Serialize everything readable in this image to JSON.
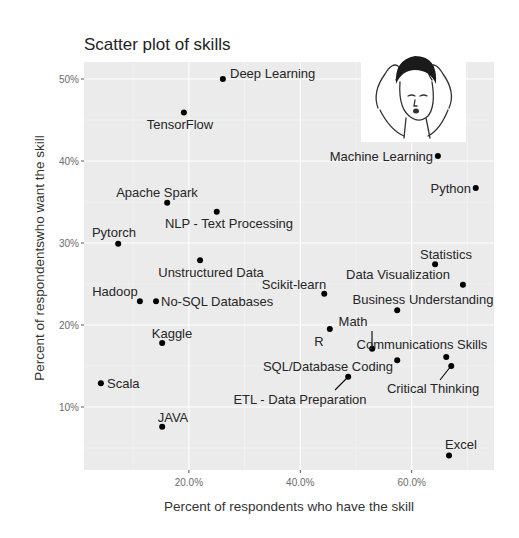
{
  "chart_data": {
    "type": "scatter",
    "title": "Scatter plot of skills",
    "xlabel": "Percent of respondents who have the skill",
    "ylabel": "Percent of respondentswho want the skill",
    "xlim": [
      1.2,
      74.8
    ],
    "ylim": [
      2.3,
      52.0
    ],
    "x_ticks": [
      {
        "value": 20,
        "label": "20.0%"
      },
      {
        "value": 40,
        "label": "40.0%"
      },
      {
        "value": 60,
        "label": "60.0%"
      }
    ],
    "y_ticks": [
      {
        "value": 10,
        "label": "10%"
      },
      {
        "value": 20,
        "label": "20%"
      },
      {
        "value": 30,
        "label": "30%"
      },
      {
        "value": 40,
        "label": "40%"
      },
      {
        "value": 50,
        "label": "50%"
      }
    ],
    "x_minor": [
      10,
      30,
      50,
      70
    ],
    "y_minor": [
      5,
      15,
      25,
      35,
      45
    ],
    "grid": true,
    "legend": null,
    "annotation_image": "stressed-man-meme",
    "points": [
      {
        "label": "Deep Learning",
        "x": 26.1,
        "y": 50.0,
        "lx": 230,
        "ly": 78,
        "anchor": "start"
      },
      {
        "label": "TensorFlow",
        "x": 19.1,
        "y": 45.9,
        "lx": 180,
        "ly": 129,
        "anchor": "middle"
      },
      {
        "label": "Machine Learning",
        "x": 64.7,
        "y": 40.6,
        "lx": 433,
        "ly": 161,
        "anchor": "end"
      },
      {
        "label": "Python",
        "x": 71.5,
        "y": 36.7,
        "lx": 471,
        "ly": 193,
        "anchor": "end"
      },
      {
        "label": "Apache Spark",
        "x": 16.1,
        "y": 34.9,
        "lx": 157,
        "ly": 197,
        "anchor": "middle"
      },
      {
        "label": "NLP - Text Processing",
        "x": 25.0,
        "y": 33.8,
        "lx": 229,
        "ly": 228,
        "anchor": "middle"
      },
      {
        "label": "Pytorch",
        "x": 7.3,
        "y": 29.9,
        "lx": 114,
        "ly": 237,
        "anchor": "middle"
      },
      {
        "label": "Statistics",
        "x": 64.2,
        "y": 27.4,
        "lx": 446,
        "ly": 259,
        "anchor": "middle"
      },
      {
        "label": "Unstructured Data",
        "x": 22.0,
        "y": 27.9,
        "lx": 211,
        "ly": 277,
        "anchor": "middle"
      },
      {
        "label": "Data Visualization",
        "x": 69.2,
        "y": 24.9,
        "lx": 398,
        "ly": 279,
        "anchor": "middle"
      },
      {
        "label": "Scikit-learn",
        "x": 44.3,
        "y": 23.8,
        "lx": 294,
        "ly": 289,
        "anchor": "middle"
      },
      {
        "label": "Hadoop",
        "x": 11.2,
        "y": 22.9,
        "lx": 115,
        "ly": 296,
        "anchor": "middle"
      },
      {
        "label": "No-SQL Databases",
        "x": 14.1,
        "y": 22.9,
        "lx": 161,
        "ly": 306,
        "anchor": "start"
      },
      {
        "label": "Business Understanding",
        "x": 57.4,
        "y": 21.8,
        "lx": 423,
        "ly": 304,
        "anchor": "middle"
      },
      {
        "label": "Math",
        "x": 52.9,
        "y": 17.1,
        "lx": 353,
        "ly": 326,
        "anchor": "middle",
        "leader": [
          372,
          331,
          372,
          349
        ]
      },
      {
        "label": "R",
        "x": 45.3,
        "y": 19.5,
        "lx": 319,
        "ly": 346,
        "anchor": "middle"
      },
      {
        "label": "Kaggle",
        "x": 15.2,
        "y": 17.8,
        "lx": 172,
        "ly": 338,
        "anchor": "middle"
      },
      {
        "label": "Communications Skills",
        "x": 66.2,
        "y": 16.1,
        "lx": 422,
        "ly": 349,
        "anchor": "middle"
      },
      {
        "label": "SQL/Database Coding",
        "x": 57.4,
        "y": 15.7,
        "lx": 328,
        "ly": 371,
        "anchor": "middle"
      },
      {
        "label": "Critical Thinking",
        "x": 67.1,
        "y": 15.0,
        "lx": 433,
        "ly": 393,
        "anchor": "middle",
        "leader": [
          451,
          366,
          440,
          380
        ]
      },
      {
        "label": "Scala",
        "x": 4.2,
        "y": 12.9,
        "lx": 107,
        "ly": 388,
        "anchor": "start"
      },
      {
        "label": "ETL - Data Preparation",
        "x": 48.6,
        "y": 13.7,
        "lx": 300,
        "ly": 404,
        "anchor": "middle",
        "leader": [
          348,
          377,
          335,
          390
        ]
      },
      {
        "label": "JAVA",
        "x": 15.2,
        "y": 7.6,
        "lx": 173,
        "ly": 422,
        "anchor": "middle"
      },
      {
        "label": "Excel",
        "x": 66.7,
        "y": 4.1,
        "lx": 461,
        "ly": 449,
        "anchor": "middle"
      }
    ]
  },
  "layout": {
    "panel": {
      "x": 84,
      "y": 62,
      "w": 410,
      "h": 408
    },
    "x_zero_px": 77.5,
    "x_px_per_unit": 5.57,
    "y_fifty_px": 79,
    "y_px_per_unit": 8.2,
    "image_box": {
      "x": 361,
      "y": 46,
      "w": 105,
      "h": 96
    }
  },
  "colors": {
    "panel_bg": "#ebebeb",
    "grid": "#ffffff",
    "points": "#000000",
    "text": "#262626",
    "tick_text": "#6b6b6b"
  }
}
